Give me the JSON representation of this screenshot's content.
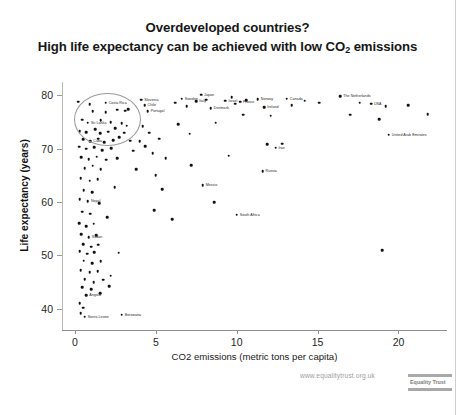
{
  "title": {
    "line1": "Overdeveloped countries?",
    "line2_pre": "High life expectancy can be achieved with low CO",
    "line2_sub": "2",
    "line2_post": " emissions"
  },
  "watermark": {
    "url": "www.equalitytrust.org.uk",
    "logo_label": "Equality Trust"
  },
  "chart_data": {
    "type": "scatter",
    "title": "Overdeveloped countries? High life expectancy can be achieved with low CO2 emissions",
    "xlabel": "CO2 emissions (metric tons per capita)",
    "ylabel": "Life expectancy (years)",
    "xlim": [
      -0.8,
      23.0
    ],
    "ylim": [
      36.0,
      82.5
    ],
    "xticks": [
      0,
      5,
      10,
      15,
      20
    ],
    "yticks": [
      40,
      50,
      60,
      70,
      80
    ],
    "grid": false,
    "legend": "none",
    "annotations": [
      {
        "type": "ellipse",
        "label": "circled cluster of low-CO2 high-life-expectancy countries",
        "center_x": 1.95,
        "center_y": 75.6,
        "width_x": 4.0,
        "height_y": 9.6
      }
    ],
    "points": [
      {
        "x": 0.2,
        "y": 78.8,
        "label": ""
      },
      {
        "x": 0.9,
        "y": 78.3,
        "label": ""
      },
      {
        "x": 1.9,
        "y": 78.6,
        "label": "Costa Rica"
      },
      {
        "x": 1.1,
        "y": 77.0,
        "label": ""
      },
      {
        "x": 1.9,
        "y": 76.8,
        "label": ""
      },
      {
        "x": 2.6,
        "y": 77.3,
        "label": ""
      },
      {
        "x": 3.1,
        "y": 77.1,
        "label": ""
      },
      {
        "x": 3.3,
        "y": 77.4,
        "label": ""
      },
      {
        "x": 0.45,
        "y": 75.4,
        "label": ""
      },
      {
        "x": 0.8,
        "y": 74.9,
        "label": "Sri Lanka"
      },
      {
        "x": 1.6,
        "y": 75.3,
        "label": ""
      },
      {
        "x": 2.2,
        "y": 75.0,
        "label": ""
      },
      {
        "x": 2.9,
        "y": 74.8,
        "label": ""
      },
      {
        "x": 3.2,
        "y": 74.3,
        "label": ""
      },
      {
        "x": 0.3,
        "y": 73.3,
        "label": ""
      },
      {
        "x": 0.7,
        "y": 73.1,
        "label": ""
      },
      {
        "x": 1.25,
        "y": 73.6,
        "label": ""
      },
      {
        "x": 1.55,
        "y": 72.9,
        "label": ""
      },
      {
        "x": 2.05,
        "y": 73.2,
        "label": ""
      },
      {
        "x": 2.5,
        "y": 73.8,
        "label": ""
      },
      {
        "x": 3.05,
        "y": 73.0,
        "label": ""
      },
      {
        "x": 0.5,
        "y": 71.8,
        "label": ""
      },
      {
        "x": 0.95,
        "y": 71.4,
        "label": "Cuba"
      },
      {
        "x": 1.45,
        "y": 71.9,
        "label": ""
      },
      {
        "x": 1.8,
        "y": 71.2,
        "label": ""
      },
      {
        "x": 2.35,
        "y": 71.6,
        "label": ""
      },
      {
        "x": 2.75,
        "y": 72.1,
        "label": ""
      },
      {
        "x": 3.4,
        "y": 71.5,
        "label": ""
      },
      {
        "x": 0.25,
        "y": 70.4,
        "label": ""
      },
      {
        "x": 0.7,
        "y": 70.0,
        "label": ""
      },
      {
        "x": 1.2,
        "y": 70.3,
        "label": ""
      },
      {
        "x": 1.7,
        "y": 69.7,
        "label": ""
      },
      {
        "x": 2.25,
        "y": 70.1,
        "label": ""
      },
      {
        "x": 3.6,
        "y": 69.6,
        "label": ""
      },
      {
        "x": 0.4,
        "y": 68.4,
        "label": ""
      },
      {
        "x": 0.85,
        "y": 68.0,
        "label": ""
      },
      {
        "x": 1.35,
        "y": 68.5,
        "label": ""
      },
      {
        "x": 1.95,
        "y": 67.9,
        "label": ""
      },
      {
        "x": 2.6,
        "y": 68.2,
        "label": ""
      },
      {
        "x": 0.6,
        "y": 66.3,
        "label": ""
      },
      {
        "x": 1.1,
        "y": 66.8,
        "label": ""
      },
      {
        "x": 1.6,
        "y": 66.1,
        "label": ""
      },
      {
        "x": 0.35,
        "y": 64.5,
        "label": ""
      },
      {
        "x": 0.9,
        "y": 64.0,
        "label": ""
      },
      {
        "x": 1.4,
        "y": 64.3,
        "label": ""
      },
      {
        "x": 0.55,
        "y": 62.2,
        "label": ""
      },
      {
        "x": 1.05,
        "y": 61.8,
        "label": ""
      },
      {
        "x": 0.3,
        "y": 60.5,
        "label": ""
      },
      {
        "x": 0.8,
        "y": 60.1,
        "label": "Nepal"
      },
      {
        "x": 1.5,
        "y": 59.8,
        "label": ""
      },
      {
        "x": 0.45,
        "y": 58.2,
        "label": ""
      },
      {
        "x": 0.95,
        "y": 57.8,
        "label": ""
      },
      {
        "x": 0.25,
        "y": 56.0,
        "label": ""
      },
      {
        "x": 0.7,
        "y": 55.5,
        "label": ""
      },
      {
        "x": 1.15,
        "y": 55.9,
        "label": ""
      },
      {
        "x": 0.4,
        "y": 54.0,
        "label": ""
      },
      {
        "x": 0.85,
        "y": 53.4,
        "label": "Sudan"
      },
      {
        "x": 1.3,
        "y": 53.8,
        "label": ""
      },
      {
        "x": 0.5,
        "y": 52.1,
        "label": ""
      },
      {
        "x": 1.0,
        "y": 51.6,
        "label": ""
      },
      {
        "x": 1.45,
        "y": 52.0,
        "label": ""
      },
      {
        "x": 0.3,
        "y": 50.8,
        "label": ""
      },
      {
        "x": 0.75,
        "y": 50.3,
        "label": ""
      },
      {
        "x": 1.2,
        "y": 50.6,
        "label": ""
      },
      {
        "x": 0.55,
        "y": 49.0,
        "label": ""
      },
      {
        "x": 1.05,
        "y": 48.5,
        "label": ""
      },
      {
        "x": 1.6,
        "y": 48.9,
        "label": ""
      },
      {
        "x": 0.35,
        "y": 47.2,
        "label": ""
      },
      {
        "x": 0.9,
        "y": 46.8,
        "label": ""
      },
      {
        "x": 1.4,
        "y": 47.0,
        "label": ""
      },
      {
        "x": 0.6,
        "y": 45.5,
        "label": ""
      },
      {
        "x": 1.15,
        "y": 45.0,
        "label": ""
      },
      {
        "x": 1.75,
        "y": 45.4,
        "label": ""
      },
      {
        "x": 0.45,
        "y": 44.0,
        "label": ""
      },
      {
        "x": 1.0,
        "y": 43.6,
        "label": ""
      },
      {
        "x": 2.1,
        "y": 44.2,
        "label": ""
      },
      {
        "x": 0.7,
        "y": 42.5,
        "label": "Angola"
      },
      {
        "x": 1.55,
        "y": 42.9,
        "label": ""
      },
      {
        "x": 0.3,
        "y": 41.0,
        "label": ""
      },
      {
        "x": 0.5,
        "y": 40.2,
        "label": ""
      },
      {
        "x": 0.35,
        "y": 39.2,
        "label": ""
      },
      {
        "x": 0.6,
        "y": 38.5,
        "label": "Sierra Leone"
      },
      {
        "x": 2.9,
        "y": 38.9,
        "label": "Botswana"
      },
      {
        "x": 4.1,
        "y": 79.2,
        "label": "Slovenia"
      },
      {
        "x": 4.3,
        "y": 78.2,
        "label": "Chile"
      },
      {
        "x": 4.5,
        "y": 77.0,
        "label": "Portugal"
      },
      {
        "x": 4.2,
        "y": 74.2,
        "label": ""
      },
      {
        "x": 4.6,
        "y": 73.0,
        "label": ""
      },
      {
        "x": 4.0,
        "y": 71.4,
        "label": ""
      },
      {
        "x": 4.35,
        "y": 70.5,
        "label": ""
      },
      {
        "x": 4.8,
        "y": 69.2,
        "label": ""
      },
      {
        "x": 5.2,
        "y": 71.9,
        "label": ""
      },
      {
        "x": 5.6,
        "y": 68.2,
        "label": ""
      },
      {
        "x": 5.0,
        "y": 65.0,
        "label": ""
      },
      {
        "x": 5.4,
        "y": 62.4,
        "label": ""
      },
      {
        "x": 6.2,
        "y": 78.6,
        "label": ""
      },
      {
        "x": 6.6,
        "y": 79.4,
        "label": "Sweden"
      },
      {
        "x": 6.9,
        "y": 78.0,
        "label": ""
      },
      {
        "x": 6.4,
        "y": 74.6,
        "label": ""
      },
      {
        "x": 7.1,
        "y": 72.8,
        "label": ""
      },
      {
        "x": 7.5,
        "y": 78.9,
        "label": "Italy"
      },
      {
        "x": 7.8,
        "y": 80.1,
        "label": "Japan"
      },
      {
        "x": 8.1,
        "y": 79.2,
        "label": ""
      },
      {
        "x": 8.4,
        "y": 77.6,
        "label": "Denmark"
      },
      {
        "x": 8.7,
        "y": 74.9,
        "label": ""
      },
      {
        "x": 7.2,
        "y": 66.9,
        "label": ""
      },
      {
        "x": 7.9,
        "y": 63.1,
        "label": "Mexico"
      },
      {
        "x": 8.6,
        "y": 60.0,
        "label": ""
      },
      {
        "x": 9.3,
        "y": 79.0,
        "label": "Israel"
      },
      {
        "x": 9.7,
        "y": 79.6,
        "label": ""
      },
      {
        "x": 9.9,
        "y": 78.4,
        "label": ""
      },
      {
        "x": 10.2,
        "y": 78.8,
        "label": "France"
      },
      {
        "x": 10.6,
        "y": 79.1,
        "label": ""
      },
      {
        "x": 10.4,
        "y": 76.4,
        "label": ""
      },
      {
        "x": 9.5,
        "y": 68.7,
        "label": ""
      },
      {
        "x": 10.0,
        "y": 57.6,
        "label": "South Africa"
      },
      {
        "x": 11.3,
        "y": 79.3,
        "label": "Norway"
      },
      {
        "x": 11.7,
        "y": 77.8,
        "label": "Ireland"
      },
      {
        "x": 12.1,
        "y": 76.2,
        "label": ""
      },
      {
        "x": 11.9,
        "y": 70.8,
        "label": ""
      },
      {
        "x": 12.4,
        "y": 70.2,
        "label": "Iran"
      },
      {
        "x": 12.8,
        "y": 70.9,
        "label": ""
      },
      {
        "x": 11.6,
        "y": 65.8,
        "label": "Russia"
      },
      {
        "x": 13.1,
        "y": 79.4,
        "label": "Canada"
      },
      {
        "x": 13.4,
        "y": 78.2,
        "label": ""
      },
      {
        "x": 14.2,
        "y": 79.0,
        "label": ""
      },
      {
        "x": 15.1,
        "y": 78.6,
        "label": ""
      },
      {
        "x": 16.4,
        "y": 79.8,
        "label": "The Netherlands"
      },
      {
        "x": 17.6,
        "y": 78.6,
        "label": ""
      },
      {
        "x": 18.3,
        "y": 78.4,
        "label": "USA"
      },
      {
        "x": 19.2,
        "y": 78.0,
        "label": ""
      },
      {
        "x": 17.0,
        "y": 76.4,
        "label": ""
      },
      {
        "x": 18.8,
        "y": 75.5,
        "label": ""
      },
      {
        "x": 19.4,
        "y": 72.6,
        "label": "United Arab Emirates"
      },
      {
        "x": 20.6,
        "y": 78.2,
        "label": ""
      },
      {
        "x": 21.8,
        "y": 76.5,
        "label": ""
      },
      {
        "x": 19.0,
        "y": 51.0,
        "label": ""
      },
      {
        "x": 4.9,
        "y": 58.5,
        "label": ""
      },
      {
        "x": 6.0,
        "y": 56.8,
        "label": ""
      },
      {
        "x": 3.8,
        "y": 66.2,
        "label": ""
      },
      {
        "x": 2.45,
        "y": 62.8,
        "label": ""
      },
      {
        "x": 2.0,
        "y": 57.2,
        "label": ""
      },
      {
        "x": 2.7,
        "y": 50.5,
        "label": ""
      },
      {
        "x": 2.2,
        "y": 46.2,
        "label": ""
      }
    ]
  }
}
